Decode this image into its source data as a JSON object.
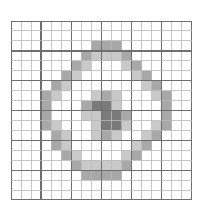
{
  "figure": {
    "title": "",
    "kind": "pixel-grid-heatmap",
    "background_color": "#ffffff"
  },
  "grid": {
    "columns": 18,
    "rows": 18,
    "cell_width": 10.05,
    "cell_height": 9.95,
    "origin_x": 11,
    "origin_y": 21,
    "minor_line_color": "#b9b9b9",
    "major_line_color": "#6f6f6f",
    "minor_line_width": 0.8,
    "major_line_width": 1.4,
    "major_every": 3,
    "empty_cell_color": "#ffffff"
  },
  "legend": {
    "levels": [
      {
        "name": "empty",
        "value": 0,
        "color": "#ffffff"
      },
      {
        "name": "light",
        "value": 1,
        "color": "#c9c9c9"
      },
      {
        "name": "medium",
        "value": 2,
        "color": "#a8a8a8"
      },
      {
        "name": "dark",
        "value": 3,
        "color": "#7a7a7a"
      }
    ]
  },
  "chart_data": {
    "type": "heatmap",
    "title": "",
    "xlabel": "",
    "ylabel": "",
    "grid": true,
    "legend_position": "none",
    "ncols": 18,
    "nrows": 18,
    "colorscale": [
      "#ffffff",
      "#c9c9c9",
      "#a8a8a8",
      "#7a7a7a"
    ],
    "values": [
      [
        0,
        0,
        0,
        0,
        0,
        0,
        0,
        0,
        0,
        0,
        0,
        0,
        0,
        0,
        0,
        0,
        0,
        0
      ],
      [
        0,
        0,
        0,
        0,
        0,
        0,
        0,
        0,
        0,
        0,
        0,
        0,
        0,
        0,
        0,
        0,
        0,
        0
      ],
      [
        0,
        0,
        0,
        0,
        0,
        0,
        0,
        0,
        2,
        2,
        2,
        0,
        0,
        0,
        0,
        0,
        0,
        0
      ],
      [
        0,
        0,
        0,
        0,
        0,
        0,
        0,
        2,
        1,
        1,
        1,
        2,
        0,
        0,
        0,
        0,
        0,
        0
      ],
      [
        0,
        0,
        0,
        0,
        0,
        0,
        2,
        1,
        0,
        0,
        0,
        1,
        2,
        0,
        0,
        0,
        0,
        0
      ],
      [
        0,
        0,
        0,
        0,
        0,
        2,
        1,
        0,
        0,
        0,
        0,
        0,
        1,
        2,
        0,
        0,
        0,
        0
      ],
      [
        0,
        0,
        0,
        0,
        2,
        1,
        0,
        0,
        0,
        0,
        0,
        0,
        0,
        1,
        2,
        0,
        0,
        0
      ],
      [
        0,
        0,
        0,
        2,
        1,
        0,
        0,
        0,
        1,
        2,
        1,
        0,
        0,
        0,
        1,
        2,
        0,
        0
      ],
      [
        0,
        0,
        0,
        2,
        0,
        0,
        0,
        2,
        3,
        3,
        1,
        0,
        0,
        0,
        0,
        2,
        0,
        0
      ],
      [
        0,
        0,
        0,
        2,
        0,
        0,
        0,
        1,
        1,
        3,
        3,
        2,
        0,
        0,
        0,
        2,
        0,
        0
      ],
      [
        0,
        0,
        0,
        2,
        1,
        0,
        0,
        0,
        1,
        3,
        3,
        1,
        0,
        0,
        1,
        2,
        0,
        0
      ],
      [
        0,
        0,
        0,
        0,
        2,
        1,
        0,
        0,
        1,
        2,
        1,
        0,
        0,
        1,
        2,
        0,
        0,
        0
      ],
      [
        0,
        0,
        0,
        0,
        2,
        1,
        0,
        0,
        0,
        0,
        0,
        0,
        1,
        2,
        0,
        0,
        0,
        0
      ],
      [
        0,
        0,
        0,
        0,
        0,
        2,
        1,
        0,
        0,
        0,
        0,
        1,
        2,
        0,
        0,
        0,
        0,
        0
      ],
      [
        0,
        0,
        0,
        0,
        0,
        0,
        2,
        1,
        1,
        1,
        1,
        2,
        0,
        0,
        0,
        0,
        0,
        0
      ],
      [
        0,
        0,
        0,
        0,
        0,
        0,
        0,
        2,
        2,
        2,
        2,
        0,
        0,
        0,
        0,
        0,
        0,
        0
      ],
      [
        0,
        0,
        0,
        0,
        0,
        0,
        0,
        0,
        0,
        0,
        0,
        0,
        0,
        0,
        0,
        0,
        0,
        0
      ],
      [
        0,
        0,
        0,
        0,
        0,
        0,
        0,
        0,
        0,
        0,
        0,
        0,
        0,
        0,
        0,
        0,
        0,
        0
      ]
    ]
  }
}
